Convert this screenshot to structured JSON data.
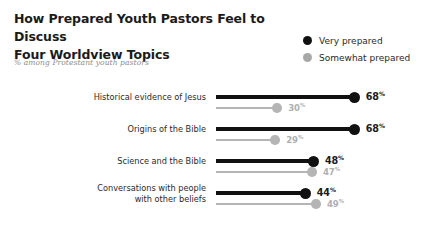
{
  "title": {
    "line1": "How Prepared Youth Pastors Feel to Discuss",
    "line2": "Four Worldview Topics"
  },
  "subtitle": "% among Protestant youth pastors",
  "legend": {
    "items": [
      {
        "label": "Very prepared",
        "color": "#111111",
        "icon": "legend-dot-black"
      },
      {
        "label": "Somewhat prepared",
        "color": "#a8a8a8",
        "icon": "legend-dot-gray"
      }
    ]
  },
  "colors": {
    "primary": "#111111",
    "secondary": "#b5b5b5",
    "primary_text": "#1b1b1b",
    "secondary_text": "#b0b0b0",
    "label_text": "#2a2a2a",
    "subtitle_text": "#8c8c8c",
    "background": "#ffffff"
  },
  "percent_symbol": "%",
  "chart_data": {
    "type": "bar",
    "title": "How Prepared Youth Pastors Feel to Discuss Four Worldview Topics",
    "subtitle": "% among Protestant youth pastors",
    "xlabel": "",
    "ylabel": "",
    "xlim": [
      0,
      100
    ],
    "grid": false,
    "legend_position": "top-right",
    "orientation": "horizontal",
    "categories": [
      "Historical evidence of Jesus",
      "Origins of the Bible",
      "Science and the Bible",
      "Conversations with people\nwith other beliefs"
    ],
    "series": [
      {
        "name": "Very prepared",
        "color": "#111111",
        "values": [
          68,
          68,
          48,
          44
        ]
      },
      {
        "name": "Somewhat prepared",
        "color": "#b5b5b5",
        "values": [
          30,
          29,
          47,
          49
        ]
      }
    ],
    "rows": [
      {
        "category": "Historical evidence of Jesus",
        "category_lines": [
          "Historical evidence of Jesus"
        ],
        "primary": {
          "value": 68,
          "label": "68"
        },
        "secondary": {
          "value": 30,
          "label": "30"
        }
      },
      {
        "category": "Origins of the Bible",
        "category_lines": [
          "Origins of the Bible"
        ],
        "primary": {
          "value": 68,
          "label": "68"
        },
        "secondary": {
          "value": 29,
          "label": "29"
        }
      },
      {
        "category": "Science and the Bible",
        "category_lines": [
          "Science and the Bible"
        ],
        "primary": {
          "value": 48,
          "label": "48"
        },
        "secondary": {
          "value": 47,
          "label": "47"
        }
      },
      {
        "category": "Conversations with people with other beliefs",
        "category_lines": [
          "Conversations with people",
          "with other beliefs"
        ],
        "primary": {
          "value": 44,
          "label": "44"
        },
        "secondary": {
          "value": 49,
          "label": "49"
        }
      }
    ]
  }
}
